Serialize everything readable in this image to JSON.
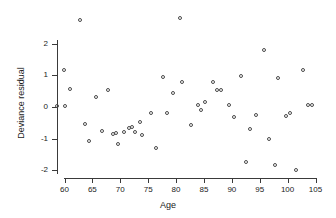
{
  "chart_data": {
    "type": "scatter",
    "title": "",
    "xlabel": "Age",
    "ylabel": "Deviance residual",
    "xlim": [
      58,
      105
    ],
    "ylim": [
      -2.4,
      2.9
    ],
    "xticks": [
      60,
      65,
      70,
      75,
      80,
      85,
      90,
      95,
      100,
      105
    ],
    "yticks": [
      2,
      1,
      0,
      -1,
      -2
    ],
    "grid": false,
    "legend": null,
    "marker": "open-circle",
    "marker_color": "#4a4a4a",
    "points": [
      {
        "x": 58.8,
        "y": 0.0
      },
      {
        "x": 60.0,
        "y": 1.12
      },
      {
        "x": 60.2,
        "y": 0.0
      },
      {
        "x": 61.2,
        "y": 0.53
      },
      {
        "x": 62.9,
        "y": 2.72
      },
      {
        "x": 63.8,
        "y": -0.57
      },
      {
        "x": 64.5,
        "y": -1.11
      },
      {
        "x": 65.9,
        "y": 0.28
      },
      {
        "x": 66.9,
        "y": -0.79
      },
      {
        "x": 67.9,
        "y": 0.49
      },
      {
        "x": 68.9,
        "y": -0.87
      },
      {
        "x": 69.4,
        "y": -0.86
      },
      {
        "x": 69.7,
        "y": -1.19
      },
      {
        "x": 70.8,
        "y": -0.81
      },
      {
        "x": 71.8,
        "y": -0.69
      },
      {
        "x": 72.2,
        "y": -0.67
      },
      {
        "x": 72.9,
        "y": -0.81
      },
      {
        "x": 73.7,
        "y": -0.52
      },
      {
        "x": 74.1,
        "y": -0.92
      },
      {
        "x": 75.7,
        "y": -0.21
      },
      {
        "x": 76.6,
        "y": -1.33
      },
      {
        "x": 77.9,
        "y": 0.92
      },
      {
        "x": 78.6,
        "y": -0.23
      },
      {
        "x": 79.7,
        "y": 0.42
      },
      {
        "x": 80.9,
        "y": 2.79
      },
      {
        "x": 81.2,
        "y": 0.76
      },
      {
        "x": 82.9,
        "y": -0.6
      },
      {
        "x": 84.1,
        "y": 0.03
      },
      {
        "x": 84.6,
        "y": -0.12
      },
      {
        "x": 85.4,
        "y": 0.12
      },
      {
        "x": 86.8,
        "y": 0.77
      },
      {
        "x": 87.6,
        "y": 0.52
      },
      {
        "x": 88.2,
        "y": 0.49
      },
      {
        "x": 89.7,
        "y": 0.03
      },
      {
        "x": 90.6,
        "y": -0.35
      },
      {
        "x": 91.8,
        "y": 0.94
      },
      {
        "x": 92.8,
        "y": -1.78
      },
      {
        "x": 93.4,
        "y": -0.72
      },
      {
        "x": 94.6,
        "y": -0.29
      },
      {
        "x": 95.9,
        "y": 1.76
      },
      {
        "x": 96.8,
        "y": -1.04
      },
      {
        "x": 97.9,
        "y": -1.87
      },
      {
        "x": 98.4,
        "y": 0.89
      },
      {
        "x": 99.9,
        "y": -0.33
      },
      {
        "x": 100.6,
        "y": -0.22
      },
      {
        "x": 101.7,
        "y": -2.03
      },
      {
        "x": 102.9,
        "y": 1.12
      },
      {
        "x": 103.9,
        "y": 0.02
      },
      {
        "x": 104.6,
        "y": 0.02
      }
    ]
  }
}
